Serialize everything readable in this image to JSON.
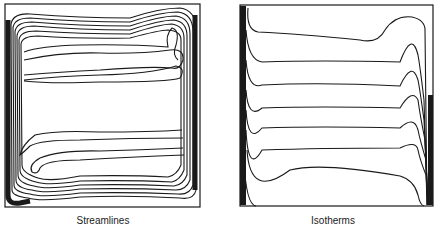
{
  "figures": [
    {
      "id": "streamlines",
      "caption": "Streamlines"
    },
    {
      "id": "isotherms",
      "caption": "Isotherms"
    }
  ],
  "colors": {
    "line": "#1a1a1a",
    "background": "#ffffff"
  }
}
